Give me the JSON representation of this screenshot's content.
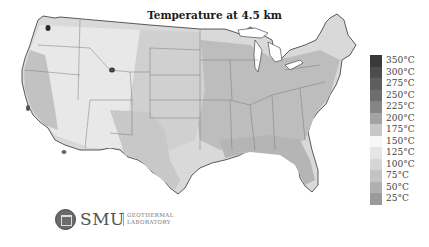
{
  "map": {
    "title": "Temperature at 4.5 km",
    "region": "Contiguous United States",
    "legend": [
      {
        "label": "350°C",
        "color": "#3a3a3a"
      },
      {
        "label": "300°C",
        "color": "#4d4d4d"
      },
      {
        "label": "275°C",
        "color": "#5e5e5e"
      },
      {
        "label": "250°C",
        "color": "#6e6e6e"
      },
      {
        "label": "225°C",
        "color": "#858585"
      },
      {
        "label": "200°C",
        "color": "#a3a3a3"
      },
      {
        "label": "175°C",
        "color": "#c8c8c8"
      },
      {
        "label": "150°C",
        "color": "#f7f7f7"
      },
      {
        "label": "125°C",
        "color": "#e6e6e6"
      },
      {
        "label": "100°C",
        "color": "#d6d6d6"
      },
      {
        "label": "75°C",
        "color": "#c4c4c4"
      },
      {
        "label": "50°C",
        "color": "#b0b0b0"
      },
      {
        "label": "25°C",
        "color": "#9a9a9a"
      }
    ]
  },
  "logo": {
    "name": "SMU",
    "line1": "GEOTHERMAL",
    "line2": "LABORATORY"
  }
}
